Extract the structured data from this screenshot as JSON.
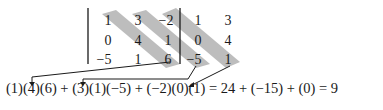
{
  "matrix": {
    "rows": [
      [
        "1",
        "3",
        "−2",
        "1",
        "3"
      ],
      [
        "0",
        "4",
        "1",
        "0",
        "4"
      ],
      [
        "−5",
        "1",
        "6",
        "−5",
        "1"
      ]
    ]
  },
  "equation": {
    "text": "(1)(4)(6) + (3)(1)(−5) + (−2)(0)(1) = 24 + (−15) + (0) = 9"
  },
  "colors": {
    "shade": "#b8b8b8",
    "ink": "#1a1a1a"
  }
}
